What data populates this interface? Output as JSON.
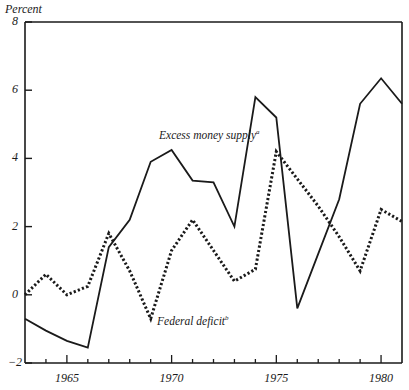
{
  "chart_data": {
    "type": "line",
    "title": "",
    "ylabel": "Percent",
    "xlabel": "",
    "ylim": [
      -2,
      8
    ],
    "xlim": [
      1963,
      1981
    ],
    "grid": false,
    "legend": "inline annotations",
    "yticks": [
      -2,
      0,
      2,
      4,
      6,
      8
    ],
    "ytick_labels": [
      "−2",
      "0",
      "2",
      "4",
      "6",
      "8"
    ],
    "xticks_major": [
      1965,
      1970,
      1975,
      1980
    ],
    "xtick_labels": [
      "1965",
      "1970",
      "1975",
      "1980"
    ],
    "x": [
      1963,
      1964,
      1965,
      1966,
      1967,
      1968,
      1969,
      1970,
      1971,
      1972,
      1973,
      1974,
      1975,
      1976,
      1977,
      1978,
      1979,
      1980,
      1981
    ],
    "series": [
      {
        "name": "Excess money supply",
        "footnote": "a",
        "style": "solid",
        "values": [
          -0.7,
          -1.05,
          -1.35,
          -1.55,
          1.4,
          2.2,
          3.9,
          4.25,
          3.35,
          3.3,
          2.0,
          5.8,
          5.2,
          -0.4,
          1.2,
          2.8,
          5.6,
          6.35,
          5.6
        ]
      },
      {
        "name": "Federal deficit",
        "footnote": "b",
        "style": "dotted",
        "values": [
          0.0,
          0.6,
          0.0,
          0.25,
          1.8,
          0.7,
          -0.7,
          1.3,
          2.2,
          1.3,
          0.4,
          0.75,
          4.2,
          3.4,
          2.6,
          1.7,
          0.7,
          2.5,
          2.15
        ]
      }
    ],
    "annotations": [
      {
        "text": "Excess money supply",
        "sup": "a",
        "x": 1970,
        "y": 4.8
      },
      {
        "text": "Federal deficit",
        "sup": "b",
        "x": 1970,
        "y": -0.9
      }
    ]
  }
}
